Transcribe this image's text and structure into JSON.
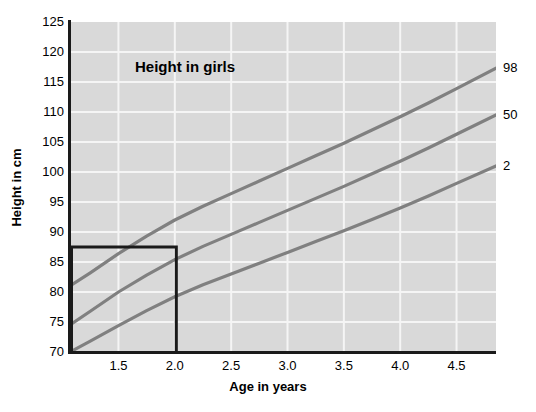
{
  "chart_data": {
    "type": "line",
    "title": "Height in girls",
    "xlabel": "Age in years",
    "ylabel": "Height in cm",
    "xlim": [
      1.07,
      4.85
    ],
    "ylim": [
      70,
      125
    ],
    "xticks": [
      "1.5",
      "2.0",
      "2.5",
      "3.0",
      "3.5",
      "4.0",
      "4.5"
    ],
    "xtick_values": [
      1.5,
      2.0,
      2.5,
      3.0,
      3.5,
      4.0,
      4.5
    ],
    "yticks": [
      "125",
      "120",
      "115",
      "110",
      "105",
      "100",
      "95",
      "90",
      "85",
      "80",
      "75",
      "70"
    ],
    "ytick_values": [
      125,
      120,
      115,
      110,
      105,
      100,
      95,
      90,
      85,
      80,
      75,
      70
    ],
    "grid": true,
    "legend_position": "right-inline-labels",
    "plot_background": "#d9d9d9",
    "gridline_color": "#f5f5f5",
    "curve_color": "#808080",
    "axis_color": "#1a1a1a",
    "series": [
      {
        "name": "98",
        "label": "98",
        "x": [
          1.07,
          1.25,
          1.5,
          1.75,
          2.0,
          2.25,
          2.5,
          2.75,
          3.0,
          3.25,
          3.5,
          3.75,
          4.0,
          4.25,
          4.5,
          4.85
        ],
        "values": [
          81.0,
          83.2,
          86.4,
          89.3,
          92.0,
          94.3,
          96.4,
          98.5,
          100.6,
          102.7,
          104.8,
          107.0,
          109.2,
          111.5,
          113.9,
          117.3
        ]
      },
      {
        "name": "50",
        "label": "50",
        "x": [
          1.07,
          1.25,
          1.5,
          1.75,
          2.0,
          2.25,
          2.5,
          2.75,
          3.0,
          3.25,
          3.5,
          3.75,
          4.0,
          4.25,
          4.5,
          4.85
        ],
        "values": [
          74.5,
          76.8,
          80.0,
          82.8,
          85.4,
          87.6,
          89.6,
          91.6,
          93.6,
          95.6,
          97.6,
          99.7,
          101.8,
          104.0,
          106.3,
          109.5
        ]
      },
      {
        "name": "2",
        "label": "2",
        "x": [
          1.07,
          1.25,
          1.5,
          1.75,
          2.0,
          2.25,
          2.5,
          2.75,
          3.0,
          3.25,
          3.5,
          3.75,
          4.0,
          4.25,
          4.5,
          4.85
        ],
        "values": [
          70.0,
          71.8,
          74.4,
          76.9,
          79.2,
          81.2,
          83.0,
          84.8,
          86.6,
          88.4,
          90.2,
          92.1,
          94.0,
          96.0,
          98.1,
          101.0
        ]
      }
    ],
    "annotations": [
      {
        "type": "rectangle",
        "name": "highlight-box",
        "x_range": [
          1.07,
          2.0
        ],
        "y_range": [
          70,
          87.5
        ]
      }
    ]
  }
}
